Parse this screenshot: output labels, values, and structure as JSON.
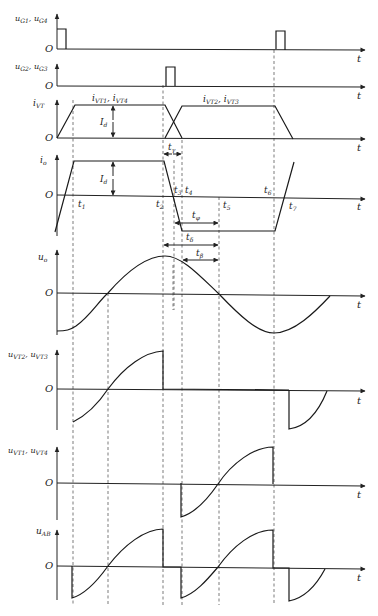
{
  "diagram": {
    "type": "waveform-timing-diagram",
    "time_axis_label": "t",
    "origin_label": "O",
    "panels": [
      {
        "id": "ug14",
        "label_main": "u",
        "label_sub": "G1",
        "label_sep": ", ",
        "label_main2": "u",
        "label_sub2": "G4"
      },
      {
        "id": "ug23",
        "label_main": "u",
        "label_sub": "G2",
        "label_sep": ", ",
        "label_main2": "u",
        "label_sub2": "G3"
      },
      {
        "id": "ivt",
        "label_main": "i",
        "label_sub": "VT"
      },
      {
        "id": "io",
        "label_main": "i",
        "label_sub": "o"
      },
      {
        "id": "uo",
        "label_main": "u",
        "label_sub": "o"
      },
      {
        "id": "uvt23",
        "label_main": "u",
        "label_sub": "VT2",
        "label_sep": ", ",
        "label_main2": "u",
        "label_sub2": "VT3"
      },
      {
        "id": "uvt14",
        "label_main": "u",
        "label_sub": "VT1",
        "label_sep": ", ",
        "label_main2": "u",
        "label_sub2": "VT4"
      },
      {
        "id": "uab",
        "label_main": "u",
        "label_sub": "AB"
      }
    ],
    "annotations": {
      "ivt_left": {
        "main": "i",
        "sub": "VT1",
        "sep": ", ",
        "main2": "i",
        "sub2": "VT4"
      },
      "ivt_right": {
        "main": "i",
        "sub": "VT2",
        "sep": ", ",
        "main2": "i",
        "sub2": "VT3"
      },
      "id_ivt": {
        "main": "I",
        "sub": "d"
      },
      "id_io": {
        "main": "I",
        "sub": "d"
      },
      "t_gamma": {
        "main": "t",
        "sub": "γ"
      },
      "t_phi": {
        "main": "t",
        "sub": "φ"
      },
      "t_delta": {
        "main": "t",
        "sub": "δ"
      },
      "t_beta_1": {
        "main": "t",
        "sub": "β"
      },
      "t_beta_2": {
        "main": "t",
        "sub": "β"
      }
    },
    "time_markers": [
      {
        "main": "t",
        "sub": "1"
      },
      {
        "main": "t",
        "sub": "2"
      },
      {
        "main": "t",
        "sub": "3"
      },
      {
        "main": "t",
        "sub": "4"
      },
      {
        "main": "t",
        "sub": "5"
      },
      {
        "main": "t",
        "sub": "6"
      },
      {
        "main": "t",
        "sub": "7"
      }
    ]
  }
}
